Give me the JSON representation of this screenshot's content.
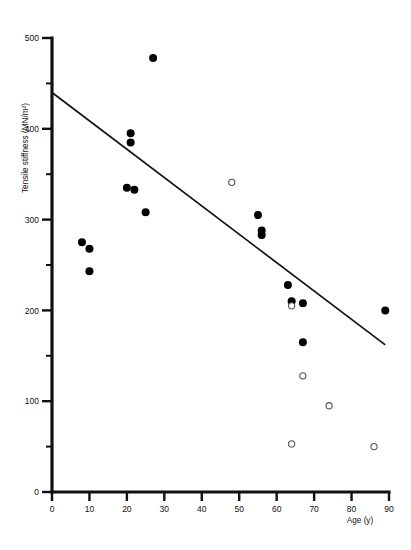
{
  "chart_data": {
    "type": "scatter",
    "title": "",
    "xlabel": "Age (y)",
    "ylabel": "Tensile stiffness (MN/m²)",
    "xlim": [
      0,
      90
    ],
    "ylim": [
      0,
      500
    ],
    "xticks": [
      0,
      10,
      20,
      30,
      40,
      50,
      60,
      70,
      80,
      90
    ],
    "yticks": [
      0,
      100,
      200,
      300,
      400,
      500
    ],
    "xtick_labels": [
      "0",
      "10",
      "20",
      "30",
      "40",
      "50",
      "60",
      "70",
      "80",
      "90"
    ],
    "ytick_labels": [
      "0",
      "100",
      "200",
      "300",
      "400",
      "500"
    ],
    "grid": false,
    "legend": "none",
    "series": [
      {
        "name": "filled-markers",
        "marker": "filled-circle",
        "color": "#000000",
        "points": [
          {
            "x": 8,
            "y": 275
          },
          {
            "x": 10,
            "y": 268
          },
          {
            "x": 10,
            "y": 243
          },
          {
            "x": 20,
            "y": 335
          },
          {
            "x": 21,
            "y": 395
          },
          {
            "x": 21,
            "y": 385
          },
          {
            "x": 22,
            "y": 333
          },
          {
            "x": 25,
            "y": 308
          },
          {
            "x": 27,
            "y": 478
          },
          {
            "x": 55,
            "y": 305
          },
          {
            "x": 56,
            "y": 288
          },
          {
            "x": 56,
            "y": 283
          },
          {
            "x": 63,
            "y": 228
          },
          {
            "x": 64,
            "y": 210
          },
          {
            "x": 67,
            "y": 208
          },
          {
            "x": 67,
            "y": 165
          },
          {
            "x": 89,
            "y": 200
          }
        ]
      },
      {
        "name": "open-markers",
        "marker": "open-circle",
        "color": "#ffffff",
        "points": [
          {
            "x": 48,
            "y": 341
          },
          {
            "x": 64,
            "y": 205
          },
          {
            "x": 64,
            "y": 53
          },
          {
            "x": 67,
            "y": 128
          },
          {
            "x": 74,
            "y": 95
          },
          {
            "x": 86,
            "y": 50
          }
        ]
      }
    ],
    "fit_line": {
      "name": "regression-line",
      "x1": 0,
      "y1": 440,
      "x2": 89,
      "y2": 162
    }
  }
}
